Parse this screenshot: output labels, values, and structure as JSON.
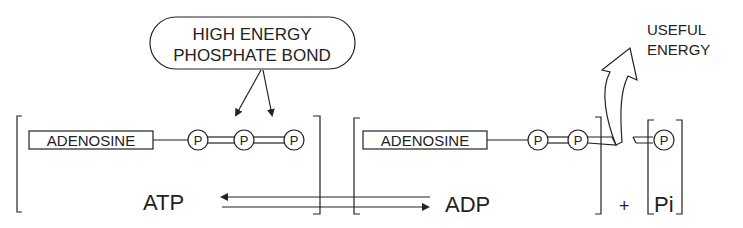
{
  "callout": {
    "line1": "HIGH ENERGY",
    "line2": "PHOSPHATE BOND"
  },
  "atp_molecule": {
    "base_label": "ADENOSINE",
    "phosphates": [
      "P",
      "P",
      "P"
    ]
  },
  "adp_molecule": {
    "base_label": "ADENOSINE",
    "phosphates": [
      "P",
      "P"
    ]
  },
  "released_phosphate": {
    "label": "P"
  },
  "energy_label": {
    "line1": "USEFUL",
    "line2": "ENERGY"
  },
  "equation": {
    "left": "ATP",
    "right": "ADP",
    "plus": "+",
    "pi": "Pi"
  },
  "colors": {
    "ink": "#222222",
    "background": "#ffffff"
  }
}
